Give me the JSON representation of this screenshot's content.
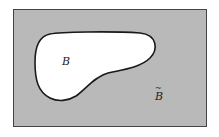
{
  "diagram": {
    "type": "venn-complement",
    "universe_fill": "#b9b9b9",
    "set_fill": "#ffffff",
    "outline_color": "#1a1a1a",
    "set_label": "B",
    "complement_label": "B",
    "complement_mark": "~"
  }
}
